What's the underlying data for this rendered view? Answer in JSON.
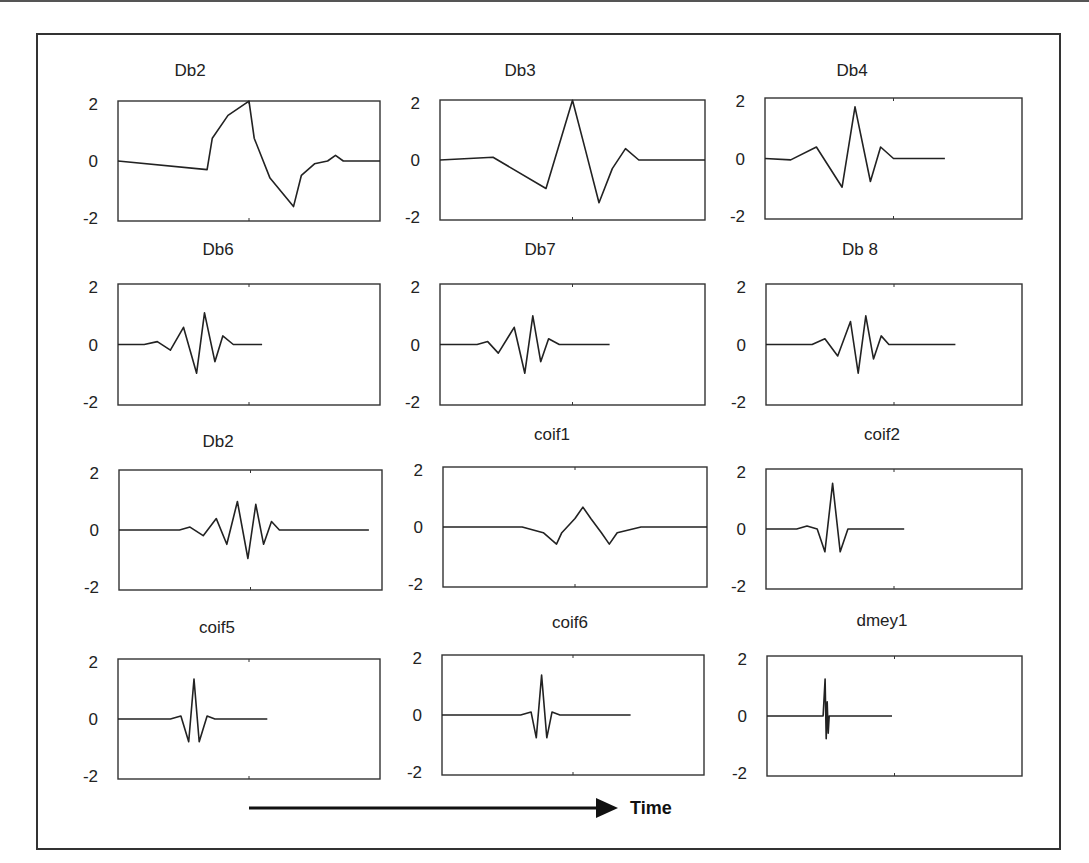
{
  "figure": {
    "time_label": "Time",
    "arrow": {
      "x1": 249,
      "x2": 618,
      "y": 808
    }
  },
  "chart_data": {
    "type": "line",
    "layout": "4x3 grid of small multiples",
    "xlabel": "Time",
    "grid": false,
    "ylim": [
      -2,
      2
    ],
    "yticks": [
      "2",
      "0",
      "-2"
    ],
    "panels": [
      {
        "title": "Db2",
        "box": [
          118,
          101,
          262,
          120
        ],
        "title_pos": [
          190,
          76
        ],
        "ticks_side": "left",
        "points": [
          [
            0,
            0
          ],
          [
            0.34,
            -0.3
          ],
          [
            0.36,
            0.8
          ],
          [
            0.42,
            1.6
          ],
          [
            0.5,
            2.1
          ],
          [
            0.52,
            0.8
          ],
          [
            0.58,
            -0.6
          ],
          [
            0.67,
            -1.6
          ],
          [
            0.7,
            -0.5
          ],
          [
            0.75,
            -0.1
          ],
          [
            0.8,
            0
          ],
          [
            0.83,
            0.2
          ],
          [
            0.86,
            0
          ],
          [
            0.9,
            0
          ],
          [
            1.0,
            0
          ]
        ],
        "x_span": 0.75
      },
      {
        "title": "Db3",
        "box": [
          440,
          100,
          265,
          120
        ],
        "title_pos": [
          520,
          76
        ],
        "ticks_side": "left",
        "points": [
          [
            0,
            0
          ],
          [
            0.2,
            0.1
          ],
          [
            0.4,
            -1.0
          ],
          [
            0.5,
            2.1
          ],
          [
            0.55,
            0.3
          ],
          [
            0.6,
            -1.5
          ],
          [
            0.65,
            -0.3
          ],
          [
            0.7,
            0.4
          ],
          [
            0.75,
            0
          ],
          [
            0.8,
            0
          ],
          [
            1.0,
            0
          ]
        ],
        "x_span": 1.0
      },
      {
        "title": "Db4",
        "box": [
          765,
          98,
          257,
          121
        ],
        "title_pos": [
          852,
          76
        ],
        "ticks_side": "left",
        "points": [
          [
            0,
            0
          ],
          [
            0.1,
            -0.05
          ],
          [
            0.2,
            0.4
          ],
          [
            0.3,
            -1.0
          ],
          [
            0.35,
            1.8
          ],
          [
            0.41,
            -0.8
          ],
          [
            0.45,
            0.4
          ],
          [
            0.5,
            0
          ],
          [
            0.7,
            0
          ]
        ],
        "x_span": 0.7
      },
      {
        "title": "Db6",
        "box": [
          118,
          284,
          262,
          121
        ],
        "title_pos": [
          218,
          255
        ],
        "ticks_side": "left",
        "points": [
          [
            0,
            0
          ],
          [
            0.1,
            0
          ],
          [
            0.15,
            0.1
          ],
          [
            0.2,
            -0.2
          ],
          [
            0.25,
            0.6
          ],
          [
            0.3,
            -1.0
          ],
          [
            0.33,
            1.1
          ],
          [
            0.37,
            -0.6
          ],
          [
            0.4,
            0.3
          ],
          [
            0.44,
            0
          ],
          [
            0.55,
            0
          ]
        ],
        "x_span": 0.55
      },
      {
        "title": "Db7",
        "box": [
          440,
          284,
          265,
          121
        ],
        "title_pos": [
          540,
          255
        ],
        "ticks_side": "left",
        "points": [
          [
            0,
            0
          ],
          [
            0.14,
            0
          ],
          [
            0.18,
            0.1
          ],
          [
            0.22,
            -0.3
          ],
          [
            0.28,
            0.6
          ],
          [
            0.32,
            -1.0
          ],
          [
            0.35,
            1.0
          ],
          [
            0.38,
            -0.6
          ],
          [
            0.41,
            0.2
          ],
          [
            0.45,
            0
          ],
          [
            0.64,
            0
          ]
        ],
        "x_span": 0.64
      },
      {
        "title": "Db 8",
        "box": [
          766,
          284,
          256,
          121
        ],
        "title_pos": [
          860,
          255
        ],
        "ticks_side": "left",
        "points": [
          [
            0,
            0
          ],
          [
            0.18,
            0
          ],
          [
            0.23,
            0.2
          ],
          [
            0.28,
            -0.4
          ],
          [
            0.33,
            0.8
          ],
          [
            0.36,
            -1.0
          ],
          [
            0.39,
            1.0
          ],
          [
            0.42,
            -0.5
          ],
          [
            0.45,
            0.3
          ],
          [
            0.48,
            0
          ],
          [
            0.74,
            0
          ]
        ],
        "x_span": 0.74
      },
      {
        "title": "Db2",
        "box": [
          119,
          470,
          263,
          120
        ],
        "title_pos": [
          218,
          447
        ],
        "ticks_side": "left",
        "points": [
          [
            0,
            0
          ],
          [
            0.23,
            0
          ],
          [
            0.27,
            0.1
          ],
          [
            0.32,
            -0.2
          ],
          [
            0.37,
            0.4
          ],
          [
            0.41,
            -0.5
          ],
          [
            0.45,
            1.0
          ],
          [
            0.49,
            -1.0
          ],
          [
            0.52,
            0.9
          ],
          [
            0.55,
            -0.5
          ],
          [
            0.58,
            0.3
          ],
          [
            0.61,
            0
          ],
          [
            0.95,
            0
          ]
        ],
        "x_span": 0.95
      },
      {
        "title": "coif1",
        "box": [
          443,
          467,
          264,
          120
        ],
        "title_pos": [
          552,
          440
        ],
        "ticks_side": "left",
        "points": [
          [
            0,
            0
          ],
          [
            0.3,
            0
          ],
          [
            0.38,
            -0.2
          ],
          [
            0.43,
            -0.6
          ],
          [
            0.45,
            -0.2
          ],
          [
            0.5,
            0.3
          ],
          [
            0.53,
            0.7
          ],
          [
            0.56,
            0.3
          ],
          [
            0.6,
            -0.2
          ],
          [
            0.63,
            -0.6
          ],
          [
            0.66,
            -0.2
          ],
          [
            0.75,
            0
          ],
          [
            1.0,
            0
          ]
        ],
        "x_span": 1.0
      },
      {
        "title": "coif2",
        "box": [
          766,
          469,
          256,
          120
        ],
        "title_pos": [
          882,
          440
        ],
        "ticks_side": "left",
        "points": [
          [
            0,
            0
          ],
          [
            0.12,
            0
          ],
          [
            0.16,
            0.1
          ],
          [
            0.2,
            0
          ],
          [
            0.23,
            -0.8
          ],
          [
            0.26,
            1.6
          ],
          [
            0.29,
            -0.8
          ],
          [
            0.32,
            0
          ],
          [
            0.35,
            0
          ],
          [
            0.54,
            0
          ]
        ],
        "x_span": 0.54
      },
      {
        "title": "coif5",
        "box": [
          118,
          659,
          262,
          120
        ],
        "title_pos": [
          217,
          633
        ],
        "ticks_side": "left",
        "points": [
          [
            0,
            0
          ],
          [
            0.2,
            0
          ],
          [
            0.24,
            0.1
          ],
          [
            0.27,
            -0.8
          ],
          [
            0.29,
            1.4
          ],
          [
            0.31,
            -0.8
          ],
          [
            0.34,
            0.1
          ],
          [
            0.37,
            0
          ],
          [
            0.57,
            0
          ]
        ],
        "x_span": 0.57
      },
      {
        "title": "coif6",
        "box": [
          442,
          655,
          262,
          120
        ],
        "title_pos": [
          570,
          628
        ],
        "ticks_side": "left",
        "points": [
          [
            0,
            0
          ],
          [
            0.3,
            0
          ],
          [
            0.34,
            0.1
          ],
          [
            0.36,
            -0.8
          ],
          [
            0.38,
            1.4
          ],
          [
            0.4,
            -0.8
          ],
          [
            0.42,
            0.1
          ],
          [
            0.45,
            0
          ],
          [
            0.72,
            0
          ]
        ],
        "x_span": 0.72
      },
      {
        "title": "dmey1",
        "box": [
          767,
          656,
          255,
          120
        ],
        "title_pos": [
          882,
          626
        ],
        "ticks_side": "left",
        "points": [
          [
            0,
            0
          ],
          [
            0.22,
            0
          ],
          [
            0.228,
            1.3
          ],
          [
            0.232,
            -0.8
          ],
          [
            0.236,
            0.5
          ],
          [
            0.24,
            -0.6
          ],
          [
            0.244,
            0
          ],
          [
            0.49,
            0
          ]
        ],
        "x_span": 0.49
      }
    ]
  }
}
